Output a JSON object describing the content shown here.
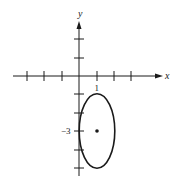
{
  "figure": {
    "axes": {
      "x_label": "x",
      "y_label": "y",
      "x_tick_label": "1",
      "y_tick_label": "−3",
      "x_ticks": [
        -3,
        -2,
        -1,
        1,
        2,
        3
      ],
      "y_ticks": [
        2,
        1,
        -1,
        -2,
        -3,
        -4,
        -5
      ]
    },
    "ellipse": {
      "center": [
        1,
        -3
      ],
      "semi_axis_x": 1,
      "semi_axis_y": 2,
      "equation": "(x-1)^2 + (y+3)^2/4 = 1"
    },
    "colors": {
      "stroke": "#1a1a1a",
      "background": "#ffffff"
    }
  }
}
